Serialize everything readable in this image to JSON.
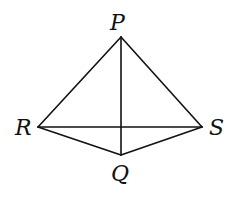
{
  "diagram": {
    "type": "geometry",
    "vertices": [
      {
        "id": "P",
        "label": "P",
        "x": 121,
        "y": 37,
        "label_x": 116,
        "label_y": 32
      },
      {
        "id": "R",
        "label": "R",
        "x": 38,
        "y": 127,
        "label_x": 16,
        "label_y": 135
      },
      {
        "id": "S",
        "label": "S",
        "x": 202,
        "y": 127,
        "label_x": 210,
        "label_y": 135
      },
      {
        "id": "Q",
        "label": "Q",
        "x": 121,
        "y": 155,
        "label_x": 112,
        "label_y": 180
      }
    ],
    "edges": [
      {
        "from": "P",
        "to": "R"
      },
      {
        "from": "P",
        "to": "S"
      },
      {
        "from": "R",
        "to": "Q"
      },
      {
        "from": "S",
        "to": "Q"
      },
      {
        "from": "R",
        "to": "S"
      },
      {
        "from": "P",
        "to": "Q"
      }
    ],
    "labels": {
      "P": "P",
      "R": "R",
      "S": "S",
      "Q": "Q"
    }
  }
}
